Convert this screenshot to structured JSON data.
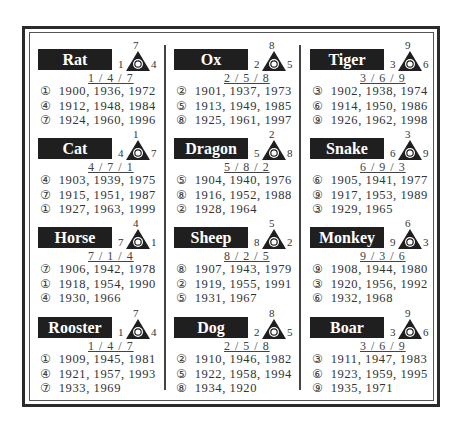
{
  "cells": [
    {
      "name": "Rat",
      "top": 7,
      "left": 1,
      "right": 4,
      "center": 5,
      "seq": "1 / 4 / 7",
      "rows": [
        [
          "①",
          "1900, 1936, 1972"
        ],
        [
          "④",
          "1912, 1948, 1984"
        ],
        [
          "⑦",
          "1924, 1960, 1996"
        ]
      ]
    },
    {
      "name": "Ox",
      "top": 8,
      "left": 2,
      "right": 5,
      "center": 5,
      "seq": "2 / 5 / 8",
      "rows": [
        [
          "②",
          "1901, 1937, 1973"
        ],
        [
          "⑤",
          "1913, 1949, 1985"
        ],
        [
          "⑧",
          "1925, 1961, 1997"
        ]
      ]
    },
    {
      "name": "Tiger",
      "top": 9,
      "left": 3,
      "right": 6,
      "center": 5,
      "seq": "3 / 6 / 9",
      "rows": [
        [
          "③",
          "1902, 1938, 1974"
        ],
        [
          "⑥",
          "1914, 1950, 1986"
        ],
        [
          "⑨",
          "1926, 1962, 1998"
        ]
      ]
    },
    {
      "name": "Cat",
      "top": 1,
      "left": 4,
      "right": 7,
      "center": 5,
      "seq": "4 / 7 / 1",
      "rows": [
        [
          "④",
          "1903, 1939, 1975"
        ],
        [
          "⑦",
          "1915, 1951, 1987"
        ],
        [
          "①",
          "1927, 1963, 1999"
        ]
      ]
    },
    {
      "name": "Dragon",
      "top": 2,
      "left": 5,
      "right": 8,
      "center": 5,
      "seq": "5 / 8 / 2",
      "rows": [
        [
          "⑤",
          "1904, 1940, 1976"
        ],
        [
          "⑧",
          "1916, 1952, 1988"
        ],
        [
          "②",
          "1928, 1964"
        ]
      ]
    },
    {
      "name": "Snake",
      "top": 3,
      "left": 6,
      "right": 9,
      "center": 5,
      "seq": "6 / 9 / 3",
      "rows": [
        [
          "⑥",
          "1905, 1941, 1977"
        ],
        [
          "⑨",
          "1917, 1953, 1989"
        ],
        [
          "③",
          "1929, 1965"
        ]
      ]
    },
    {
      "name": "Horse",
      "top": 4,
      "left": 7,
      "right": 1,
      "center": 5,
      "seq": "7 / 1 / 4",
      "rows": [
        [
          "⑦",
          "1906, 1942, 1978"
        ],
        [
          "①",
          "1918, 1954, 1990"
        ],
        [
          "④",
          "1930, 1966"
        ]
      ]
    },
    {
      "name": "Sheep",
      "top": 5,
      "left": 8,
      "right": 2,
      "center": 5,
      "seq": "8 / 2 / 5",
      "rows": [
        [
          "⑧",
          "1907, 1943, 1979"
        ],
        [
          "②",
          "1919, 1955, 1991"
        ],
        [
          "⑤",
          "1931, 1967"
        ]
      ]
    },
    {
      "name": "Monkey",
      "top": 6,
      "left": 9,
      "right": 3,
      "center": 5,
      "seq": "9 / 3 / 6",
      "rows": [
        [
          "⑨",
          "1908, 1944, 1980"
        ],
        [
          "③",
          "1920, 1956, 1992"
        ],
        [
          "⑥",
          "1932, 1968"
        ]
      ]
    },
    {
      "name": "Rooster",
      "top": 7,
      "left": 1,
      "right": 4,
      "center": 5,
      "seq": "1 / 4 / 7",
      "rows": [
        [
          "①",
          "1909, 1945, 1981"
        ],
        [
          "④",
          "1921, 1957, 1993"
        ],
        [
          "⑦",
          "1933, 1969"
        ]
      ]
    },
    {
      "name": "Dog",
      "top": 8,
      "left": 2,
      "right": 5,
      "center": 5,
      "seq": "2 / 5 / 8",
      "rows": [
        [
          "②",
          "1910, 1946, 1982"
        ],
        [
          "⑤",
          "1922, 1958, 1994"
        ],
        [
          "⑧",
          "1934, 1920"
        ]
      ]
    },
    {
      "name": "Boar",
      "top": 9,
      "left": 3,
      "right": 6,
      "center": 5,
      "seq": "3 / 6 / 9",
      "rows": [
        [
          "③",
          "1911, 1947, 1983"
        ],
        [
          "⑥",
          "1923, 1959, 1995"
        ],
        [
          "⑨",
          "1935, 1971"
        ]
      ]
    }
  ]
}
